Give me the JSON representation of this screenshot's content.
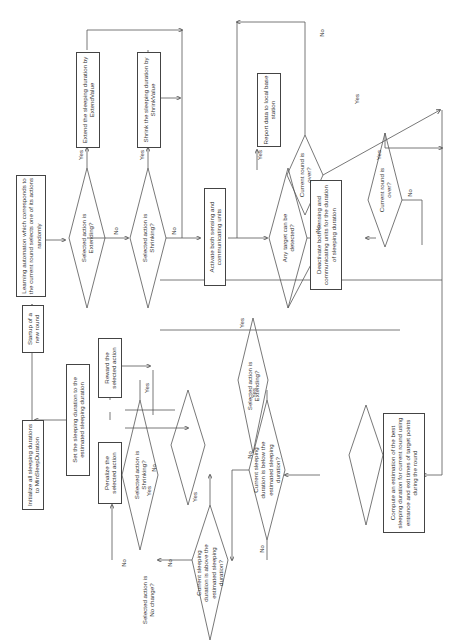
{
  "diagram": {
    "title": "",
    "orientation": "rotated-90-ccw",
    "nodes": {
      "init": {
        "text": "Initialize all sleeping durations to MinSleepDuration"
      },
      "startup": {
        "text": "Startup of a new round"
      },
      "learning": {
        "text": "Learning automaton which corresponds to the current round selects one of its actions randomly"
      },
      "q_extending": {
        "text": "Selected action is Extending?"
      },
      "extend_box": {
        "text": "Extend the sleeping duration by ExtendValue"
      },
      "q_shrinking": {
        "text": "Selected action is Shrinking?"
      },
      "shrink_box": {
        "text": "Shrink the sleeping duration by ShrinkValue"
      },
      "activate": {
        "text": "Activate both sensing and communicating units"
      },
      "q_target": {
        "text": "Any target can be detected?"
      },
      "report": {
        "text": "Report data to local base station"
      },
      "q_round_over_1": {
        "text": "Current round is over?"
      },
      "deactivate": {
        "text": "Deactivate both sensing and communicating units for the duration of sleeping duration"
      },
      "q_round_over_2": {
        "text": "Current round is over?"
      },
      "compute": {
        "text": "Compute an estimation of the best sleeping duration for current round using entrance and exit times of target points during the round"
      },
      "q_below": {
        "text": "Current sleeping duration is below the estimated sleeping duration?"
      },
      "q_above": {
        "text": "Current sleeping duration is above the estimated sleeping duration?"
      },
      "q_extending_2": {
        "text": "Selected action is Extending?"
      },
      "q_shrinking_2": {
        "text": "Selected action is Shrinking?"
      },
      "q_nochange": {
        "text": "Selected action is No change?"
      },
      "reward": {
        "text": "Reward the selected action"
      },
      "penalize": {
        "text": "Penalize the selected action"
      },
      "set_duration": {
        "text": "Set the sleeping duration to the estimated sleeping duration"
      }
    },
    "labels": {
      "yes": "Yes",
      "no": "No"
    }
  }
}
